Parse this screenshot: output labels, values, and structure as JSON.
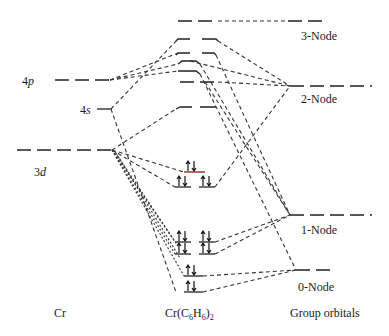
{
  "diagram": {
    "type": "molecular-orbital-diagram",
    "columns": {
      "left": {
        "title": "Cr",
        "levels": [
          {
            "name": "4p",
            "label": "4",
            "label_italic": "p",
            "y": 80
          },
          {
            "name": "4s",
            "label": "4",
            "label_italic": "s",
            "y": 108
          },
          {
            "name": "3d",
            "label": "3",
            "label_italic": "d",
            "y": 150
          }
        ]
      },
      "center": {
        "title_main": "Cr(C",
        "title_sub1": "6",
        "title_mid": "H",
        "title_sub2": "6",
        "title_end": ")",
        "title_sub3": "2",
        "levels": [
          {
            "y": 21,
            "occupied": false
          },
          {
            "y": 39,
            "occupied": false
          },
          {
            "y": 53,
            "occupied": false
          },
          {
            "y": 62,
            "occupied": false
          },
          {
            "y": 71,
            "occupied": false
          },
          {
            "y": 82,
            "occupied": false
          },
          {
            "y": 108,
            "occupied": false
          },
          {
            "y": 166,
            "occupied": true,
            "electrons": "↑↓"
          },
          {
            "y": 186,
            "occupied": true,
            "electrons": "↑↓ ↑↓"
          },
          {
            "y": 234,
            "occupied": true,
            "electrons": "↑↓ ↑↓"
          },
          {
            "y": 246,
            "occupied": true,
            "electrons": "↑↓ ↑↓"
          },
          {
            "y": 276,
            "occupied": true,
            "electrons": "↑↓"
          },
          {
            "y": 291,
            "occupied": true,
            "electrons": "↑↓"
          }
        ]
      },
      "right": {
        "title": "Group orbitals",
        "levels": [
          {
            "name": "3-Node",
            "label": "3-Node",
            "y": 21
          },
          {
            "name": "2-Node",
            "label": "2-Node",
            "y": 86
          },
          {
            "name": "1-Node",
            "label": "1-Node",
            "y": 215
          },
          {
            "name": "0-Node",
            "label": "0-Node",
            "y": 268
          }
        ]
      }
    },
    "colors": {
      "line": "#222222",
      "background": "#ffffff",
      "highlight_level": "#8b1a1a"
    }
  }
}
